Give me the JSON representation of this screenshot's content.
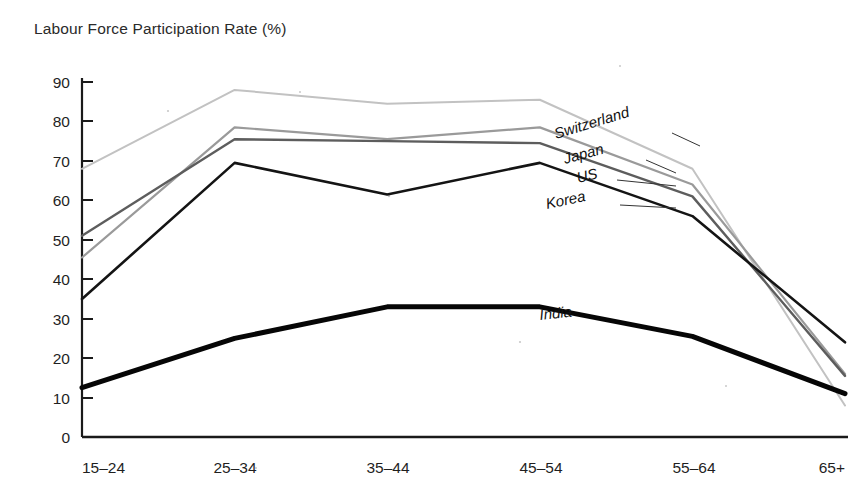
{
  "chart_data": {
    "type": "line",
    "title": "Labour Force Participation Rate (%)",
    "xlabel": "",
    "ylabel": "",
    "ylim": [
      0,
      90
    ],
    "ytick_step": 10,
    "yticks": [
      "0",
      "10",
      "20",
      "30",
      "40",
      "50",
      "60",
      "70",
      "80",
      "90"
    ],
    "grid": false,
    "legend_position": "inline-right-labels",
    "categories": [
      "15–24",
      "25–34",
      "35–44",
      "45–54",
      "55–64",
      "65+"
    ],
    "series": [
      {
        "name": "Switzerland",
        "color": "#c2c2c2",
        "width": 2.0,
        "values": [
          68,
          88,
          84.5,
          85.5,
          68,
          8
        ]
      },
      {
        "name": "Japan",
        "color": "#9a9a9a",
        "width": 2.2,
        "values": [
          45.5,
          78.5,
          75.5,
          78.5,
          64,
          16
        ]
      },
      {
        "name": "US",
        "color": "#5d5d5d",
        "width": 2.4,
        "values": [
          51,
          75.5,
          75,
          74.5,
          61,
          15.5
        ]
      },
      {
        "name": "Korea",
        "color": "#141414",
        "width": 2.6,
        "values": [
          35,
          69.5,
          61.5,
          69.5,
          56,
          24
        ]
      },
      {
        "name": "India",
        "color": "#060606",
        "width": 5.0,
        "values": [
          12.5,
          25,
          33,
          33,
          25.5,
          11
        ]
      }
    ],
    "annotations": [
      {
        "text": "Switzerland",
        "series": "Switzerland"
      },
      {
        "text": "Japan",
        "series": "Japan"
      },
      {
        "text": "US",
        "series": "US"
      },
      {
        "text": "Korea",
        "series": "Korea"
      },
      {
        "text": "India",
        "series": "India"
      }
    ]
  },
  "labels": {
    "switzerland": "Switzerland",
    "japan": "Japan",
    "us": "US",
    "korea": "Korea",
    "india": "India"
  },
  "yticks": {
    "t0": "0",
    "t10": "10",
    "t20": "20",
    "t30": "30",
    "t40": "40",
    "t50": "50",
    "t60": "60",
    "t70": "70",
    "t80": "80",
    "t90": "90"
  },
  "categories": {
    "c0": "15–24",
    "c1": "25–34",
    "c2": "35–44",
    "c3": "45–54",
    "c4": "55–64",
    "c5": "65+"
  }
}
